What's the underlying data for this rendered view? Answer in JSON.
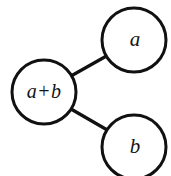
{
  "diagram": {
    "type": "tree-graph",
    "background_color": "#ffffff",
    "stroke_color": "#111111",
    "node_fill": "#ffffff",
    "stroke_width": 3,
    "nodes": [
      {
        "id": "sum",
        "label": "a+b",
        "label_parts": {
          "left": "a",
          "operator": "+",
          "right": "b"
        },
        "cx": 44,
        "cy": 92,
        "r": 32,
        "role": "parent"
      },
      {
        "id": "a",
        "label": "a",
        "cx": 134,
        "cy": 40,
        "r": 32,
        "role": "child-upper"
      },
      {
        "id": "b",
        "label": "b",
        "cx": 134,
        "cy": 147,
        "r": 32,
        "role": "child-lower"
      }
    ],
    "edges": [
      {
        "id": "edge-sum-a",
        "from": "sum",
        "to": "a",
        "x1": 71,
        "y1": 76,
        "x2": 110,
        "y2": 54
      },
      {
        "id": "edge-sum-b",
        "from": "sum",
        "to": "b",
        "x1": 71,
        "y1": 109,
        "x2": 109,
        "y2": 131
      }
    ]
  }
}
